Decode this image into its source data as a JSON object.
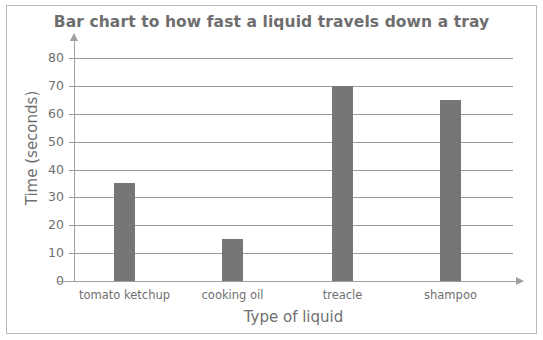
{
  "chart_data": {
    "type": "bar",
    "title": "Bar chart to how fast a liquid travels down a tray",
    "xlabel": "Type of liquid",
    "ylabel": "Time (seconds)",
    "categories": [
      "tomato ketchup",
      "cooking oil",
      "treacle",
      "shampoo"
    ],
    "values": [
      35,
      15,
      70,
      65
    ],
    "ylim": [
      0,
      80
    ],
    "ytick_step": 10,
    "yticks": [
      0,
      10,
      20,
      30,
      40,
      50,
      60,
      70,
      80
    ],
    "ytick_labels": [
      "0",
      "10",
      "20",
      "30",
      "40",
      "50",
      "60",
      "70",
      "80"
    ],
    "grid": true,
    "legend": "none",
    "bar_color": "#767676",
    "grid_color": "#9a9a9a",
    "axis_color": "#a0a0a0",
    "text_color": "#6f6f6f",
    "title_color": "#6e6e6e",
    "border_color": "#b9b9b9",
    "background": "#ffffff"
  }
}
